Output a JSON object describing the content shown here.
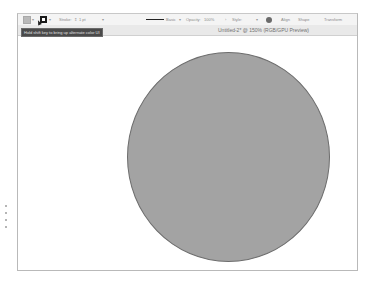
{
  "app": {
    "document_title": "Untitled-2* @ 150% (RGB/GPU Preview)"
  },
  "control_bar": {
    "fill_label": "Fill",
    "stroke_color_label": "Stroke color",
    "stroke_label": "Stroke:",
    "stroke_weight": "1 pt",
    "brush_label": "Basic",
    "opacity_label": "Opacity:",
    "opacity_value": "100%",
    "style_label": "Style:",
    "align_label": "Align",
    "shape_label": "Shape",
    "transform_label": "Transform"
  },
  "tooltip": {
    "text": "Hold shift key to bring up alternate color UI"
  },
  "canvas": {
    "shape": "ellipse",
    "fill_color": "#a3a3a3",
    "stroke_color": "#6d6d6d"
  }
}
